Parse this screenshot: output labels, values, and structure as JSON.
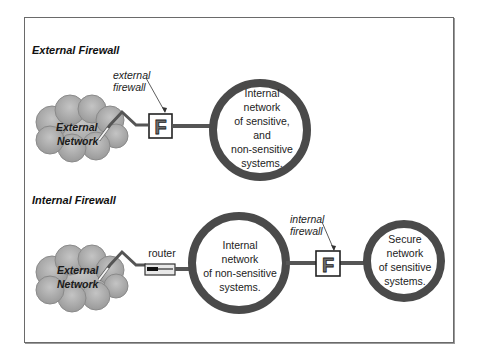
{
  "figure": {
    "sections": [
      {
        "title": "External Firewall",
        "cloud": {
          "line1": "External",
          "line2": "Network"
        },
        "device": {
          "type": "firewall",
          "letter": "F"
        },
        "callout": {
          "line1": "external",
          "line2": "firewall"
        },
        "networks": [
          {
            "lines": [
              "Internal",
              "network",
              "of sensitive,",
              "and",
              "non-sensitive",
              "systems."
            ]
          }
        ]
      },
      {
        "title": "Internal Firewall",
        "cloud": {
          "line1": "External",
          "line2": "Network"
        },
        "router": {
          "label": "router"
        },
        "device": {
          "type": "firewall",
          "letter": "F"
        },
        "callout": {
          "line1": "internal",
          "line2": "firewall"
        },
        "networks": [
          {
            "lines": [
              "Internal",
              "network",
              "of non-sensitive",
              "systems."
            ]
          },
          {
            "lines": [
              "Secure",
              "network",
              "of sensitive",
              "systems."
            ]
          }
        ]
      }
    ],
    "colors": {
      "ring": "#4a4a4a",
      "link": "#555555",
      "cloud_fill": "#a9a9a9",
      "cloud_edge": "#8a8a8a",
      "box_border": "#222222",
      "frame": "#6a6a6a"
    }
  }
}
